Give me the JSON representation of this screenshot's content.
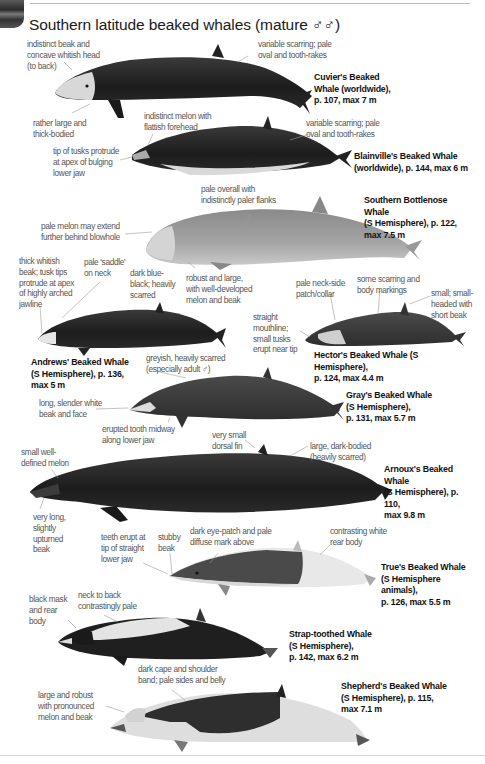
{
  "page": {
    "title": "Southern latitude beaked whales (mature ♂♂)",
    "colors": {
      "ink": "#111111",
      "annotation": "#555555",
      "leader": "#9a9a9a",
      "background": "#ffffff"
    }
  },
  "species": [
    {
      "id": "cuviers",
      "name": "Cuvier's Beaked\nWhale (worldwide),\np. 107, max 7 m",
      "page": 107,
      "max_length_m": 7,
      "range": "worldwide",
      "notes": [
        "indistinct beak and\nconcave whitish head\n(to back)",
        "variable scarring; pale\noval and tooth-rakes",
        "rather large and\nthick-bodied"
      ]
    },
    {
      "id": "blainvilles",
      "name": "Blainville's Beaked Whale\n(worldwide), p. 144, max 6 m",
      "page": 144,
      "max_length_m": 6,
      "range": "worldwide",
      "notes": [
        "indistinct melon with\nflattish forehead",
        "variable scarring; pale\noval and tooth-rakes",
        "tip of tusks protrude\nat apex of bulging\nlower jaw"
      ]
    },
    {
      "id": "southern-bottlenose",
      "name": "Southern Bottlenose Whale\n(S Hemisphere), p. 122,\nmax 7.5 m",
      "page": 122,
      "max_length_m": 7.5,
      "range": "S Hemisphere",
      "notes": [
        "pale overall with\nindistinctly paler flanks",
        "pale melon may extend\nfurther behind blowhole",
        "robust and large,\nwith well-developed\nmelon and beak"
      ]
    },
    {
      "id": "andrews",
      "name": "Andrews' Beaked Whale\n(S Hemisphere), p. 136,\nmax 5 m",
      "page": 136,
      "max_length_m": 5,
      "range": "S Hemisphere",
      "notes": [
        "thick whitish\nbeak; tusk tips\nprotrude at apex\nof highly arched\njawline",
        "pale 'saddle'\non neck",
        "dark blue-\nblack; heavily\nscarred"
      ]
    },
    {
      "id": "hectors",
      "name": "Hector's Beaked Whale (S Hemisphere),\np. 124, max 4.4 m",
      "page": 124,
      "max_length_m": 4.4,
      "range": "S Hemisphere",
      "notes": [
        "pale neck-side\npatch/collar",
        "some scarring and\nbody markings",
        "small; small-\nheaded with\nshort beak",
        "straight\nmouthline;\nsmall tusks\nerupt near tip"
      ]
    },
    {
      "id": "grays",
      "name": "Gray's Beaked Whale\n(S Hemisphere),\np. 131, max 5.7 m",
      "page": 131,
      "max_length_m": 5.7,
      "range": "S Hemisphere",
      "notes": [
        "greyish, heavily scarred\n(especially adult ♂)",
        "long, slender white\nbeak and face",
        "erupted tooth midway\nalong lower jaw"
      ]
    },
    {
      "id": "arnouxs",
      "name": "Arnoux's Beaked Whale\n(S Hemisphere), p. 110,\nmax 9.8 m",
      "page": 110,
      "max_length_m": 9.8,
      "range": "S Hemisphere",
      "notes": [
        "very small\ndorsal fin",
        "large, dark-bodied\n(heavily scarred)",
        "small well-\ndefined melon",
        "very long,\nslightly\nupturned\nbeak"
      ]
    },
    {
      "id": "trues",
      "name": "True's Beaked Whale\n(S Hemisphere animals),\np. 126, max 5.5 m",
      "page": 126,
      "max_length_m": 5.5,
      "range": "S Hemisphere animals",
      "notes": [
        "teeth erupt at\ntip of straight\nlower jaw",
        "stubby\nbeak",
        "dark eye-patch and pale\ndiffuse mark above",
        "contrasting white\nrear body"
      ]
    },
    {
      "id": "strap-toothed",
      "name": "Strap-toothed Whale\n(S Hemisphere),\np. 142, max 6.2 m",
      "page": 142,
      "max_length_m": 6.2,
      "range": "S Hemisphere",
      "notes": [
        "black mask\nand rear\nbody",
        "neck to back\ncontrastingly pale"
      ]
    },
    {
      "id": "shepherds",
      "name": "Shepherd's Beaked Whale\n(S Hemisphere), p. 115,\nmax 7.1 m",
      "page": 115,
      "max_length_m": 7.1,
      "range": "S Hemisphere",
      "notes": [
        "dark cape and shoulder\nband; pale sides and belly",
        "large and robust\nwith pronounced\nmelon and beak"
      ]
    }
  ]
}
